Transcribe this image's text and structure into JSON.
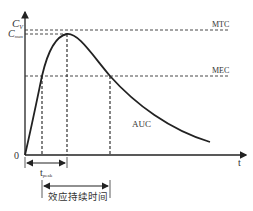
{
  "diagram": {
    "y_axis": {
      "labels": {
        "cv": "C",
        "cv_sub": "V",
        "cmax": "C",
        "cmax_sub": "max"
      }
    },
    "x_axis": {
      "label": "t",
      "origin": "0"
    },
    "thresholds": {
      "mtc": "MTC",
      "mec": "MEC"
    },
    "area_label": "AUC",
    "annotations": {
      "tpeak": "t",
      "tpeak_sub": "peak",
      "duration": "效应持续时间"
    },
    "colors": {
      "line": "#222222",
      "dashed": "#333333",
      "text": "#333333"
    }
  }
}
